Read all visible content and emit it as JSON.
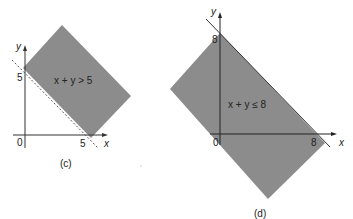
{
  "panels": [
    {
      "id": "c",
      "caption": "(c)",
      "inequality": "x + y > 5",
      "y_axis_label": "y",
      "x_axis_label": "x",
      "origin_label": "0",
      "y_intercept_label": "5",
      "x_intercept_label": "5",
      "boundary_style": "dashed",
      "shaded_region_color": "#8c8c8c"
    },
    {
      "id": "d",
      "caption": "(d)",
      "inequality": "x + y ≤ 8",
      "y_axis_label": "y",
      "x_axis_label": "x",
      "origin_label": "0",
      "y_intercept_label": "8",
      "x_intercept_label": "8",
      "boundary_style": "solid",
      "shaded_region_color": "#8c8c8c"
    }
  ]
}
